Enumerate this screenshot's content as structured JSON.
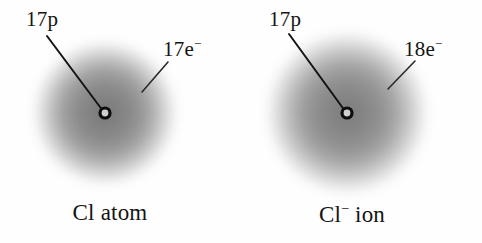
{
  "figure": {
    "background_color": "#fefefe",
    "cloud_color": "#6b6b6b",
    "line_color": "#141414",
    "text_color": "#141414"
  },
  "diagrams": [
    {
      "id": "cl-atom",
      "caption": "Cl atom",
      "caption_base": "Cl atom",
      "caption_sup": "",
      "proton_label": "17p",
      "electron_label_base": "17e",
      "electron_label_sup": "−",
      "electron_label": "17e⁻",
      "cloud": {
        "cx": 105,
        "cy": 113,
        "r": 78
      },
      "nucleus": {
        "cx": 105,
        "cy": 113,
        "r": 5
      },
      "proton_leader": {
        "x1": 47,
        "y1": 36,
        "x2": 103,
        "y2": 111
      },
      "electron_leader": {
        "x1": 142,
        "y1": 92,
        "x2": 168,
        "y2": 62
      }
    },
    {
      "id": "cl-minus-ion",
      "caption": "Cl⁻ ion",
      "caption_base": "Cl",
      "caption_sup": "−",
      "caption_tail": " ion",
      "proton_label": "17p",
      "electron_label_base": "18e",
      "electron_label_sup": "−",
      "electron_label": "18e⁻",
      "cloud": {
        "cx": 347,
        "cy": 113,
        "r": 88
      },
      "nucleus": {
        "cx": 347,
        "cy": 113,
        "r": 5
      },
      "proton_leader": {
        "x1": 289,
        "y1": 34,
        "x2": 345,
        "y2": 111
      },
      "electron_leader": {
        "x1": 388,
        "y1": 89,
        "x2": 415,
        "y2": 61
      }
    }
  ]
}
